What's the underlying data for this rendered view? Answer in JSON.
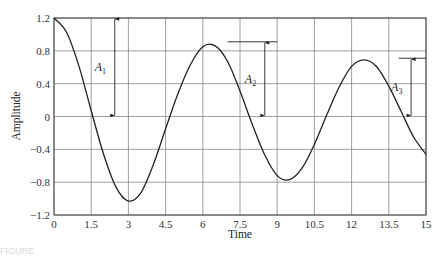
{
  "chart_data": {
    "type": "line",
    "title": "",
    "xlabel": "Time",
    "ylabel": "Amplitude",
    "xlim": [
      0,
      15
    ],
    "ylim": [
      -1.2,
      1.2
    ],
    "grid": true,
    "legend": null,
    "x_ticks": [
      "0",
      "1.5",
      "3",
      "4.5",
      "6",
      "7.5",
      "9",
      "10.5",
      "12",
      "13.5",
      "15"
    ],
    "y_ticks": [
      "1.2",
      "0.8",
      "0.4",
      "0",
      "-0.4",
      "-0.8",
      "-1.2"
    ],
    "series": [
      {
        "name": "damped oscillation",
        "x": [
          0,
          0.5,
          1,
          1.5,
          2,
          2.5,
          3,
          3.5,
          4,
          4.5,
          5,
          5.5,
          6,
          6.5,
          7,
          7.5,
          8,
          8.5,
          9,
          9.5,
          10,
          10.5,
          11,
          11.5,
          12,
          12.5,
          13,
          13.5,
          14,
          14.5,
          15
        ],
        "y": [
          1.2,
          1.03,
          0.62,
          0.07,
          -0.46,
          -0.86,
          -1.03,
          -0.93,
          -0.59,
          -0.15,
          0.28,
          0.63,
          0.85,
          0.86,
          0.67,
          0.31,
          -0.1,
          -0.47,
          -0.72,
          -0.77,
          -0.63,
          -0.34,
          0.02,
          0.36,
          0.61,
          0.69,
          0.61,
          0.37,
          0.06,
          -0.25,
          -0.46
        ]
      }
    ],
    "annotations": [
      {
        "label": "A",
        "subscript": "1",
        "x": 2.45,
        "from": 0,
        "to": 1.2
      },
      {
        "label": "A",
        "subscript": "2",
        "x": 8.5,
        "from": 0,
        "to": 0.91,
        "ref_line_x": [
          7,
          9
        ]
      },
      {
        "label": "A",
        "subscript": "3",
        "x": 14.4,
        "from": 0,
        "to": 0.71,
        "ref_line_x": [
          13.9,
          15
        ]
      }
    ]
  },
  "caption_fragment": "FIGURE"
}
